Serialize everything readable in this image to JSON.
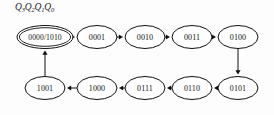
{
  "diagram": {
    "register_label": {
      "text": "Q3Q2Q1Q0",
      "parts": [
        {
          "base": "Q",
          "sub": "3"
        },
        {
          "base": "Q",
          "sub": "2"
        },
        {
          "base": "Q",
          "sub": "1"
        },
        {
          "base": "Q",
          "sub": "0"
        }
      ]
    },
    "colors": {
      "background": "#fdfdfd",
      "stroke": "#111111",
      "text": "#111111",
      "node_fill": "#ffffff"
    },
    "nodes": [
      {
        "id": "n0",
        "label": "0000/1010",
        "cx": 45,
        "cy": 37,
        "rx": 28,
        "ry": 11.5,
        "double": true,
        "row": "top"
      },
      {
        "id": "n1",
        "label": "0001",
        "cx": 97,
        "cy": 37,
        "rx": 20,
        "ry": 11.5,
        "double": false,
        "row": "top"
      },
      {
        "id": "n2",
        "label": "0010",
        "cx": 145,
        "cy": 37,
        "rx": 20,
        "ry": 11.5,
        "double": false,
        "row": "top"
      },
      {
        "id": "n3",
        "label": "0011",
        "cx": 192,
        "cy": 37,
        "rx": 20,
        "ry": 11.5,
        "double": false,
        "row": "top"
      },
      {
        "id": "n4",
        "label": "0100",
        "cx": 238,
        "cy": 37,
        "rx": 20,
        "ry": 11.5,
        "double": false,
        "row": "top"
      },
      {
        "id": "n5",
        "label": "0101",
        "cx": 238,
        "cy": 88,
        "rx": 20,
        "ry": 11.5,
        "double": false,
        "row": "bottom"
      },
      {
        "id": "n6",
        "label": "0110",
        "cx": 192,
        "cy": 88,
        "rx": 20,
        "ry": 11.5,
        "double": false,
        "row": "bottom"
      },
      {
        "id": "n7",
        "label": "0111",
        "cx": 145,
        "cy": 88,
        "rx": 20,
        "ry": 11.5,
        "double": false,
        "row": "bottom"
      },
      {
        "id": "n8",
        "label": "1000",
        "cx": 97,
        "cy": 88,
        "rx": 20,
        "ry": 11.5,
        "double": false,
        "row": "bottom"
      },
      {
        "id": "n9",
        "label": "1001",
        "cx": 45,
        "cy": 88,
        "rx": 20,
        "ry": 11.5,
        "double": false,
        "row": "bottom"
      }
    ],
    "edges": [
      {
        "from": "n0",
        "to": "n1",
        "direction": "right"
      },
      {
        "from": "n1",
        "to": "n2",
        "direction": "right"
      },
      {
        "from": "n2",
        "to": "n3",
        "direction": "right"
      },
      {
        "from": "n3",
        "to": "n4",
        "direction": "right"
      },
      {
        "from": "n4",
        "to": "n5",
        "direction": "down"
      },
      {
        "from": "n5",
        "to": "n6",
        "direction": "left"
      },
      {
        "from": "n6",
        "to": "n7",
        "direction": "left"
      },
      {
        "from": "n7",
        "to": "n8",
        "direction": "left"
      },
      {
        "from": "n8",
        "to": "n9",
        "direction": "left"
      },
      {
        "from": "n9",
        "to": "n0",
        "direction": "up"
      }
    ]
  }
}
